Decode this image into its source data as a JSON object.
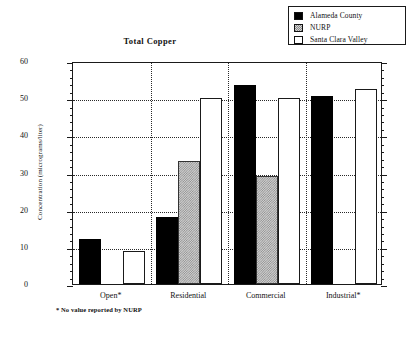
{
  "chart_data": {
    "type": "bar",
    "title": "Total  Copper",
    "xlabel": "",
    "ylabel": "Concentration (micrograms/liter)",
    "ylim": [
      0,
      60
    ],
    "yticks": [
      0,
      10,
      20,
      30,
      40,
      50,
      60
    ],
    "ytick_labels": [
      "0",
      "10",
      "20",
      "30",
      "40",
      "50",
      "60"
    ],
    "minor_tick_step": 2,
    "grid": "horizontal-dotted + vertical-group-dividers",
    "legend_position": "top-right",
    "categories": [
      "Open*",
      "Residential",
      "Commercial",
      "Industrial*"
    ],
    "series": [
      {
        "name": "Alameda County",
        "key": "alameda",
        "fill": "solid-black",
        "values": [
          12,
          18,
          53.5,
          50.5
        ]
      },
      {
        "name": "NURP",
        "key": "nurp",
        "fill": "gray-pattern",
        "values": [
          null,
          33,
          29,
          null
        ]
      },
      {
        "name": "Santa Clara Valley",
        "key": "scv",
        "fill": "white-open",
        "values": [
          9,
          50,
          50,
          52.5
        ]
      }
    ],
    "footnote": "* No value reported by NURP",
    "colors": {
      "alameda": "#000000",
      "nurp": "#cfcfcf",
      "santa_clara_valley": "#ffffff",
      "axis": "#1a1a1a",
      "grid": "#2a2a2a",
      "background": "#ffffff"
    }
  },
  "legend": {
    "items": [
      {
        "label": "Alameda County"
      },
      {
        "label": "NURP"
      },
      {
        "label": "Santa Clara Valley"
      }
    ]
  }
}
